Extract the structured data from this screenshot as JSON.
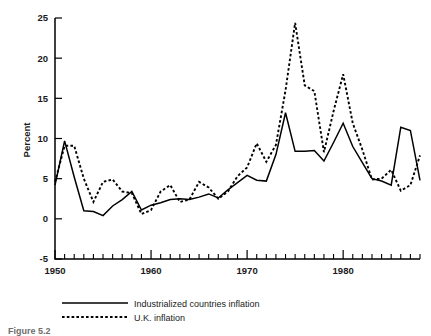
{
  "chart_data": {
    "type": "line",
    "title": "",
    "subtitle": "",
    "xlabel": "",
    "ylabel": "Percent",
    "xlim": [
      1950,
      1988
    ],
    "ylim": [
      -5,
      25
    ],
    "grid": false,
    "legend_position": "below-axes",
    "y_ticks": [
      -5,
      0,
      5,
      10,
      15,
      20,
      25
    ],
    "y_tick_labels": [
      "-5",
      "0",
      "5",
      "10",
      "15",
      "20",
      "25"
    ],
    "x_ticks": [
      1950,
      1960,
      1970,
      1980
    ],
    "x_tick_labels": [
      "1950",
      "1960",
      "1970",
      "1980"
    ],
    "x_minor_tick_step": 1,
    "x": [
      1950,
      1951,
      1952,
      1953,
      1954,
      1955,
      1956,
      1957,
      1958,
      1959,
      1960,
      1961,
      1962,
      1963,
      1964,
      1965,
      1966,
      1967,
      1968,
      1969,
      1970,
      1971,
      1972,
      1973,
      1974,
      1975,
      1976,
      1977,
      1978,
      1979,
      1980,
      1981,
      1982,
      1983,
      1984,
      1985,
      1986,
      1987,
      1988
    ],
    "series": [
      {
        "name": "Industrialized countries inflation",
        "style": "solid",
        "color": "#000000",
        "values": [
          4.2,
          9.7,
          5.2,
          1.0,
          0.9,
          0.4,
          1.6,
          2.4,
          3.4,
          1.1,
          1.7,
          2.0,
          2.4,
          2.5,
          2.4,
          2.7,
          3.1,
          2.6,
          3.6,
          4.5,
          5.4,
          4.8,
          4.7,
          8.0,
          13.2,
          8.4,
          8.4,
          8.5,
          7.2,
          9.5,
          11.9,
          9.0,
          7.0,
          5.0,
          4.7,
          4.2,
          11.4,
          11.0,
          4.8
        ]
      },
      {
        "name": "U.K. inflation",
        "style": "dashed",
        "color": "#000000",
        "values": [
          4.6,
          9.1,
          9.1,
          5.0,
          2.1,
          4.6,
          4.9,
          3.4,
          3.2,
          0.6,
          1.1,
          3.4,
          4.2,
          2.1,
          2.4,
          4.6,
          3.9,
          2.5,
          3.4,
          5.3,
          6.4,
          9.4,
          7.1,
          9.2,
          16.0,
          24.4,
          16.6,
          15.9,
          8.3,
          13.4,
          18.0,
          11.9,
          8.6,
          4.9,
          5.0,
          6.1,
          3.5,
          4.2,
          7.9
        ]
      }
    ],
    "legend": [
      {
        "label": "Industrialized countries inflation",
        "style": "solid"
      },
      {
        "label": "U.K. inflation",
        "style": "dashed"
      }
    ],
    "annotations": []
  },
  "caption": {
    "text": "Figure 5.2"
  }
}
